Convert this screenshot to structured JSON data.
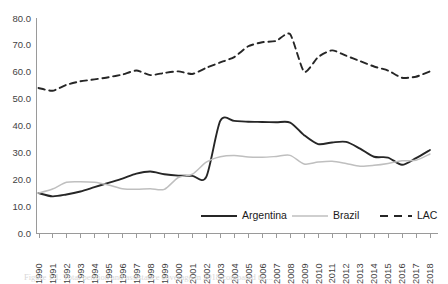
{
  "chart_data": {
    "type": "line",
    "title": "",
    "xlabel": "",
    "ylabel": "",
    "ylim": [
      0,
      80
    ],
    "ytick_labels": [
      "0.0",
      "10.0",
      "20.0",
      "30.0",
      "40.0",
      "50.0",
      "60.0",
      "70.0",
      "80.0"
    ],
    "ytick_values": [
      0,
      10,
      20,
      30,
      40,
      50,
      60,
      70,
      80
    ],
    "grid": false,
    "legend_position": "bottom-center",
    "x": [
      1990,
      1991,
      1992,
      1993,
      1994,
      1995,
      1996,
      1997,
      1998,
      1999,
      2000,
      2001,
      2002,
      2003,
      2004,
      2005,
      2006,
      2007,
      2008,
      2009,
      2010,
      2011,
      2012,
      2013,
      2014,
      2015,
      2016,
      2017,
      2018
    ],
    "categories": [
      "1990",
      "1991",
      "1992",
      "1993",
      "1994",
      "1995",
      "1996",
      "1997",
      "1998",
      "1999",
      "2000",
      "2001",
      "2002",
      "2003",
      "2004",
      "2005",
      "2006",
      "2007",
      "2008",
      "2009",
      "2010",
      "2011",
      "2012",
      "2013",
      "2014",
      "2015",
      "2016",
      "2017",
      "2018"
    ],
    "series": [
      {
        "name": "Argentina",
        "color": "#262626",
        "style": "solid",
        "values": [
          15.0,
          13.8,
          14.5,
          15.6,
          17.2,
          18.8,
          20.4,
          22.2,
          23.0,
          22.0,
          21.5,
          21.4,
          21.0,
          41.8,
          41.8,
          41.5,
          41.4,
          41.3,
          41.2,
          36.5,
          33.2,
          33.8,
          34.0,
          31.5,
          28.5,
          28.2,
          25.5,
          28.0,
          31.0
        ]
      },
      {
        "name": "Brazil",
        "color": "#bfbfbf",
        "style": "solid",
        "values": [
          15.0,
          16.5,
          19.0,
          19.2,
          19.0,
          18.0,
          16.6,
          16.4,
          16.6,
          16.4,
          20.8,
          22.0,
          26.5,
          28.5,
          29.0,
          28.4,
          28.3,
          28.6,
          29.0,
          25.8,
          26.5,
          26.8,
          26.0,
          25.0,
          25.3,
          26.0,
          27.0,
          27.2,
          29.5
        ]
      },
      {
        "name": "LAC",
        "color": "#262626",
        "style": "dashed",
        "values": [
          54.0,
          53.0,
          55.2,
          56.5,
          57.2,
          58.0,
          59.0,
          60.5,
          58.8,
          59.6,
          60.2,
          59.2,
          61.5,
          63.5,
          65.5,
          69.5,
          71.0,
          71.5,
          74.0,
          60.0,
          65.5,
          68.0,
          66.0,
          64.0,
          62.0,
          60.5,
          57.8,
          58.2,
          60.2
        ]
      }
    ]
  },
  "legend": {
    "items": [
      {
        "label": "Argentina"
      },
      {
        "label": "Brazil"
      },
      {
        "label": "LAC"
      }
    ]
  },
  "caption": {
    "text": "Figure 1.1. Total pension and assistance coverage in 2018 compared to ..."
  }
}
